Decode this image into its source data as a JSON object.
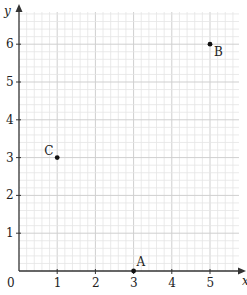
{
  "chart_data": {
    "type": "scatter",
    "title": "",
    "xlabel": "x",
    "ylabel": "y",
    "xlim": [
      0,
      5.8
    ],
    "ylim": [
      0,
      6.6
    ],
    "x_ticks": [
      0,
      1,
      2,
      3,
      4,
      5
    ],
    "y_ticks": [
      1,
      2,
      3,
      4,
      5,
      6
    ],
    "x_tick_labels": [
      "0",
      "1",
      "2",
      "3",
      "4",
      "5"
    ],
    "y_tick_labels": [
      "1",
      "2",
      "3",
      "4",
      "5",
      "6"
    ],
    "grid": true,
    "minor_divisions_per_unit": 5,
    "legend": null,
    "points": [
      {
        "label": "A",
        "x": 3,
        "y": 0
      },
      {
        "label": "B",
        "x": 5,
        "y": 6
      },
      {
        "label": "C",
        "x": 1,
        "y": 3
      }
    ]
  },
  "colors": {
    "grid_minor": "#e4e4e4",
    "grid_major": "#cfcfcf",
    "axis": "#333333",
    "point": "#111111",
    "text": "#222222"
  }
}
